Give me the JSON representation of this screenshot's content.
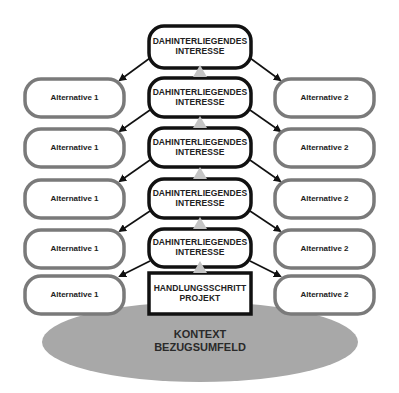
{
  "diagram": {
    "center_nodes": [
      {
        "line1": "DAHINTERLIEGENDES",
        "line2": "INTERESSE"
      },
      {
        "line1": "DAHINTERLIEGENDES",
        "line2": "INTERESSE"
      },
      {
        "line1": "DAHINTERLIEGENDES",
        "line2": "INTERESSE"
      },
      {
        "line1": "DAHINTERLIEGENDES",
        "line2": "INTERESSE"
      },
      {
        "line1": "DAHINTERLIEGENDES",
        "line2": "INTERESSE"
      }
    ],
    "base_node": {
      "line1": "HANDLUNGSSCHRITT",
      "line2": "PROJEKT"
    },
    "left_alternatives": [
      "Alternative 1",
      "Alternative 1",
      "Alternative 1",
      "Alternative 1",
      "Alternative 1"
    ],
    "right_alternatives": [
      "Alternative 2",
      "Alternative 2",
      "Alternative 2",
      "Alternative 2",
      "Alternative 2"
    ],
    "context": {
      "line1": "KONTEXT",
      "line2": "BEZUGSUMFELD"
    },
    "colors": {
      "center_border": "#111111",
      "alt_border": "#7a7a7a",
      "ellipse_fill": "#a8a8a8",
      "triangle_fill": "#c4c4c4"
    }
  }
}
